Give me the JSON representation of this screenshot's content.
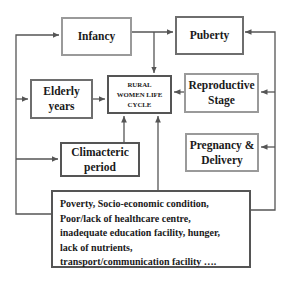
{
  "diagram": {
    "center": {
      "lines": [
        "RURAL",
        "WOMEN LIFE",
        "CYCLE"
      ]
    },
    "nodes": {
      "infancy": {
        "label": "Infancy"
      },
      "puberty": {
        "label": "Puberty"
      },
      "elderly_years": {
        "lines": [
          "Elderly",
          "years"
        ]
      },
      "reproductive_stage": {
        "lines": [
          "Reproductive",
          "Stage"
        ]
      },
      "climacteric_period": {
        "lines": [
          "Climacteric",
          "period"
        ]
      },
      "pregnancy_delivery": {
        "lines": [
          "Pregnancy &",
          "Delivery"
        ]
      }
    },
    "factors": {
      "lines": [
        "Poverty, Socio-economic condition,",
        "Poor/lack of healthcare centre,",
        "inadequate education facility, hunger,",
        "lack of nutrients,",
        "transport/communication facility …."
      ]
    },
    "colors": {
      "line": "#555555",
      "border_light": "#9a9a9a",
      "border_dark": "#555555",
      "text": "#1a1a1a"
    }
  }
}
